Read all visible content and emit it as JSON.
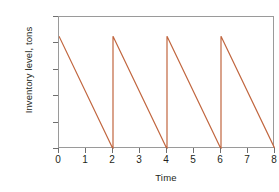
{
  "chart_data": {
    "type": "line",
    "title": "",
    "xlabel": "Time",
    "ylabel": "Inventory level, tons",
    "xlim": [
      0,
      8
    ],
    "ylim": [
      0,
      1
    ],
    "grid": false,
    "legend": null,
    "line_color": "#c1663f",
    "axis_color": "#9a9a9a",
    "background": "#ffffff",
    "xticks": [
      0,
      1,
      2,
      3,
      4,
      5,
      6,
      7,
      8
    ],
    "xtick_labels": [
      "0",
      "1",
      "2",
      "3",
      "4",
      "5",
      "6",
      "7",
      "8"
    ],
    "ytick_count": 6,
    "ytick_labels": [
      "",
      "",
      "",
      "",
      "",
      ""
    ],
    "ytick_values": [
      0,
      0.2,
      0.4,
      0.6,
      0.8,
      1.0
    ],
    "cycle_length": 2,
    "peak_value": 0.855,
    "trough_value": 0.0,
    "series": [
      {
        "name": "Inventory level",
        "x": [
          0,
          2,
          2,
          4,
          4,
          6,
          6,
          8
        ],
        "y": [
          0.855,
          0.0,
          0.855,
          0.0,
          0.855,
          0.0,
          0.855,
          0.0
        ]
      }
    ]
  }
}
